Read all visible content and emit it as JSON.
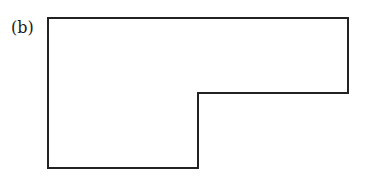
{
  "figure": {
    "label": "(b)",
    "shape": {
      "type": "L-shaped polygon",
      "stroke_color": "#222222",
      "points": [
        [
          48,
          18
        ],
        [
          348,
          18
        ],
        [
          348,
          93
        ],
        [
          198,
          93
        ],
        [
          198,
          168
        ],
        [
          48,
          168
        ]
      ]
    }
  }
}
